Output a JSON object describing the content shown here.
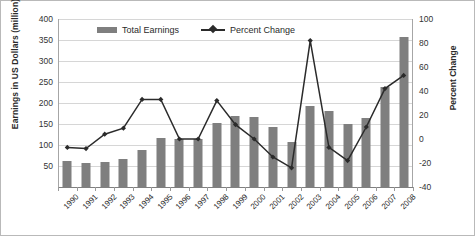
{
  "chart_data": {
    "type": "bar",
    "title": "",
    "subtitle": "",
    "xlabel": "",
    "ylabel": "Earnings in US Dollars (million)",
    "y2label": "Percent Change",
    "grid": true,
    "legend_position": "top-inside",
    "ylim": [
      0,
      400
    ],
    "y_ticks": [
      0,
      50,
      100,
      150,
      200,
      250,
      300,
      350,
      400
    ],
    "y2lim": [
      -40,
      100
    ],
    "y2_ticks": [
      -40,
      -20,
      0,
      20,
      40,
      60,
      80,
      100
    ],
    "categories": [
      "1990",
      "1991",
      "1992",
      "1993",
      "1994",
      "1995",
      "1996",
      "1997",
      "1998",
      "1999",
      "2000",
      "2001",
      "2002",
      "2003",
      "2004",
      "2005",
      "2006",
      "2007",
      "2008"
    ],
    "series": [
      {
        "name": "Total Earnings",
        "type": "bar",
        "axis": "left",
        "color": "#7f7f7f",
        "values": [
          62,
          57,
          60,
          66,
          88,
          117,
          115,
          115,
          152,
          169,
          167,
          142,
          108,
          194,
          181,
          149,
          164,
          237,
          356
        ]
      },
      {
        "name": "Percent Change",
        "type": "line",
        "axis": "right",
        "color": "#2b2b2b",
        "marker": "diamond",
        "values": [
          -7,
          -8,
          4,
          9,
          33,
          33,
          0,
          0,
          32,
          12,
          0,
          -15,
          -24,
          82,
          -7,
          -18,
          10,
          42,
          53
        ]
      }
    ]
  },
  "legend": {
    "items": [
      {
        "label": "Total Earnings",
        "swatch": "bar-swatch"
      },
      {
        "label": "Percent Change",
        "swatch": "line-marker-swatch"
      }
    ]
  },
  "axes": {
    "left_title": "Earnings in US Dollars (million)",
    "right_title": "Percent Change",
    "left_ticks": [
      "400",
      "350",
      "300",
      "250",
      "200",
      "150",
      "100",
      "50"
    ],
    "right_ticks": [
      "100",
      "80",
      "60",
      "40",
      "20",
      "0",
      "-20",
      "-40"
    ]
  }
}
